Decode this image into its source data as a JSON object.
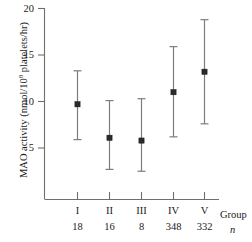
{
  "chart_data": {
    "type": "scatter",
    "title": "",
    "xlabel": "Group",
    "ylabel": "MAO activity (nmol/10^8 platelets/hr)",
    "ylabel_prefix": "MAO activity (nmol/10",
    "ylabel_exponent": "8",
    "ylabel_suffix": " platelets/hr)",
    "categories": [
      "I",
      "II",
      "III",
      "IV",
      "V"
    ],
    "n_label": "n",
    "n_values": [
      18,
      16,
      8,
      348,
      332
    ],
    "values": [
      9.7,
      6.1,
      5.8,
      11.0,
      13.2
    ],
    "error_upper": [
      13.3,
      10.1,
      10.3,
      15.9,
      18.8
    ],
    "error_lower": [
      5.9,
      2.7,
      2.5,
      6.2,
      7.6
    ],
    "ylim": [
      0,
      20
    ],
    "yticks": [
      5,
      10,
      15,
      20
    ],
    "ytick_labels": [
      "5",
      "10",
      "15",
      "20"
    ],
    "grid": false,
    "legend": "none",
    "marker_color": "#2b2b2b",
    "errorbar_color": "#7d7d7d",
    "axis_color": "#6e6e6e"
  }
}
